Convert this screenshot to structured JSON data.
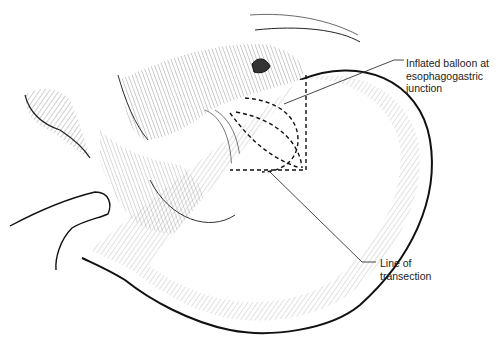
{
  "figure": {
    "colors": {
      "ink": "#111111",
      "background": "#ffffff",
      "leader": "#333333"
    },
    "labels": [
      {
        "id": "balloon",
        "lines": [
          "Inflated balloon at",
          "esophagogastric",
          "junction"
        ]
      },
      {
        "id": "transection",
        "lines": [
          "Line of",
          "transection"
        ]
      }
    ]
  }
}
